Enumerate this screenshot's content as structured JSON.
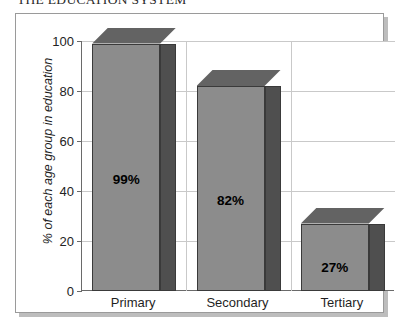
{
  "document": {
    "title": "THE EDUCATION SYSTEM"
  },
  "chart_data": {
    "type": "bar",
    "title": "THE EDUCATION SYSTEM",
    "xlabel": "",
    "ylabel": "% of each age group in education",
    "categories": [
      "Primary",
      "Secondary",
      "Tertiary"
    ],
    "values": [
      99,
      82,
      27
    ],
    "data_labels": [
      "99%",
      "82%",
      "27%"
    ],
    "ylim": [
      0,
      100
    ],
    "yticks": [
      0,
      20,
      40,
      60,
      80,
      100
    ],
    "ytick_labels": [
      "0",
      "20",
      "40",
      "60",
      "80",
      "100"
    ],
    "grid": true,
    "legend": false,
    "style": "3d-bar",
    "colors": {
      "bar_front": "#8c8c8c",
      "bar_top": "#636363",
      "bar_side": "#4f4f4f",
      "bar_outline": "#3a3a3a",
      "gridline": "#c9c9c9",
      "axis": "#6a6a6a",
      "frame": "#9a9a9a",
      "background": "#ffffff",
      "text": "#1f1f1f"
    }
  }
}
